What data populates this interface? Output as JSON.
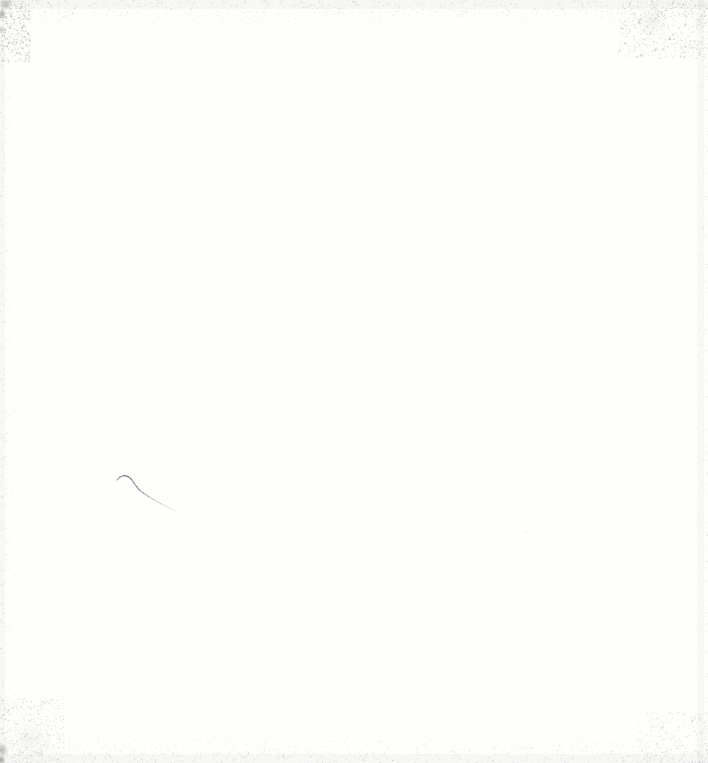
{
  "document": {
    "kind": "blank-scanned-page",
    "page_background": "#fefefd",
    "paper_white": "#ffffff",
    "edge_noise_color": "#8d8d88",
    "soft_edge_tint": "#b9b9b4"
  },
  "pen_mark": {
    "color": "#4d4d4d",
    "points": [
      [
        117,
        480
      ],
      [
        120,
        477
      ],
      [
        124,
        475.5
      ],
      [
        128,
        476.5
      ],
      [
        131,
        479
      ],
      [
        134,
        483
      ],
      [
        136.5,
        486.5
      ],
      [
        139.5,
        490
      ],
      [
        143.5,
        493
      ],
      [
        148.5,
        496.5
      ],
      [
        154.5,
        500
      ],
      [
        161.5,
        504
      ],
      [
        168.5,
        507.5
      ],
      [
        174.5,
        510.5
      ],
      [
        179.5,
        513
      ]
    ],
    "alphas": [
      0.45,
      0.55,
      0.6,
      0.6,
      0.58,
      0.55,
      0.55,
      0.52,
      0.46,
      0.4,
      0.33,
      0.26,
      0.18,
      0.1,
      0.05
    ],
    "widths": [
      1.0,
      1.2,
      1.3,
      1.3,
      1.25,
      1.2,
      1.2,
      1.15,
      1.1,
      1.0,
      1.0,
      0.9,
      0.85,
      0.8,
      0.7
    ]
  },
  "soft_bands": [
    {
      "name": "top-edge-smear",
      "x": 0,
      "y": 0,
      "w": 708,
      "h": 9,
      "alpha": 0.06
    },
    {
      "name": "bottom-edge-smear",
      "x": 0,
      "y": 754,
      "w": 708,
      "h": 9,
      "alpha": 0.06
    },
    {
      "name": "right-edge-band",
      "x": 697,
      "y": 0,
      "w": 7,
      "h": 763,
      "alpha": 0.05
    },
    {
      "name": "left-edge-band",
      "x": 0,
      "y": 0,
      "w": 5,
      "h": 763,
      "alpha": 0.05
    }
  ],
  "noise_regions": [
    {
      "name": "top-band",
      "x": 0,
      "y": 0,
      "w": 708,
      "h": 26,
      "count": 2200,
      "min_alpha": 0.03,
      "max_alpha": 0.3,
      "fade": "down"
    },
    {
      "name": "bottom-band",
      "x": 0,
      "y": 733,
      "w": 708,
      "h": 30,
      "count": 2200,
      "min_alpha": 0.03,
      "max_alpha": 0.3,
      "fade": "up"
    },
    {
      "name": "left-column",
      "x": 0,
      "y": 0,
      "w": 14,
      "h": 763,
      "count": 1300,
      "min_alpha": 0.03,
      "max_alpha": 0.24,
      "fade": "right"
    },
    {
      "name": "right-column",
      "x": 694,
      "y": 0,
      "w": 14,
      "h": 763,
      "count": 1100,
      "min_alpha": 0.03,
      "max_alpha": 0.2,
      "fade": "left"
    },
    {
      "name": "top-left-corner",
      "x": 0,
      "y": 0,
      "w": 30,
      "h": 62,
      "count": 650,
      "min_alpha": 0.05,
      "max_alpha": 0.45,
      "fade": "none"
    },
    {
      "name": "top-right-corner",
      "x": 618,
      "y": 0,
      "w": 90,
      "h": 58,
      "count": 950,
      "min_alpha": 0.04,
      "max_alpha": 0.38,
      "fade": "none"
    },
    {
      "name": "bottom-left-corner",
      "x": 0,
      "y": 698,
      "w": 64,
      "h": 65,
      "count": 700,
      "min_alpha": 0.04,
      "max_alpha": 0.3,
      "fade": "none"
    },
    {
      "name": "bottom-right-corner",
      "x": 636,
      "y": 712,
      "w": 72,
      "h": 51,
      "count": 450,
      "min_alpha": 0.04,
      "max_alpha": 0.28,
      "fade": "none"
    },
    {
      "name": "interior-dust",
      "x": 20,
      "y": 30,
      "w": 668,
      "h": 700,
      "count": 170,
      "min_alpha": 0.02,
      "max_alpha": 0.06,
      "fade": "none"
    }
  ],
  "blobs": [
    {
      "name": "top-left-edge-mark",
      "x": 2,
      "y": 14,
      "r": 5,
      "alpha": 0.45
    },
    {
      "name": "top-left-edge-mark-2",
      "x": 1,
      "y": 30,
      "r": 4,
      "alpha": 0.3
    },
    {
      "name": "top-left-corner-smudge",
      "x": 6,
      "y": 4,
      "r": 7,
      "alpha": 0.3
    },
    {
      "name": "bottom-left-corner-blob",
      "x": 2,
      "y": 750,
      "r": 7,
      "alpha": 0.4
    },
    {
      "name": "bottom-left-corner-tip",
      "x": 1,
      "y": 760,
      "r": 5,
      "alpha": 0.5
    },
    {
      "name": "top-right-patch",
      "x": 652,
      "y": 22,
      "r": 16,
      "alpha": 0.07
    },
    {
      "name": "bottom-left-haze",
      "x": 30,
      "y": 740,
      "r": 22,
      "alpha": 0.05
    }
  ],
  "specks": [
    {
      "x": 525,
      "y": 531,
      "alpha": 0.16
    },
    {
      "x": 316,
      "y": 372,
      "alpha": 0.1
    },
    {
      "x": 277,
      "y": 228,
      "alpha": 0.12
    },
    {
      "x": 269,
      "y": 233,
      "alpha": 0.09
    },
    {
      "x": 243,
      "y": 251,
      "alpha": 0.09
    },
    {
      "x": 339,
      "y": 213,
      "alpha": 0.08
    },
    {
      "x": 521,
      "y": 387,
      "alpha": 0.07
    },
    {
      "x": 183,
      "y": 434,
      "alpha": 0.07
    },
    {
      "x": 646,
      "y": 211,
      "alpha": 0.07
    },
    {
      "x": 445,
      "y": 730,
      "alpha": 0.08
    }
  ]
}
